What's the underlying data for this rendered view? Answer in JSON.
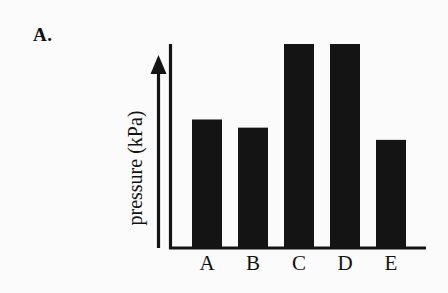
{
  "figure": {
    "panel_label": "A.",
    "background_color": "#fbfbfb",
    "ink_color": "#141414"
  },
  "chart_data": {
    "type": "bar",
    "title": "",
    "subtitle": "",
    "xlabel": "",
    "ylabel": "pressure (kPa)",
    "categories": [
      "A",
      "B",
      "C",
      "D",
      "E"
    ],
    "values": [
      63,
      59,
      100,
      100,
      53
    ],
    "series": [
      {
        "name": "pressure",
        "values": [
          63,
          59,
          100,
          100,
          53
        ]
      }
    ],
    "ylim": [
      0,
      110
    ],
    "grid": false,
    "legend": false,
    "legend_position": "none",
    "y_tick_labels": [],
    "x_tick_labels": [
      "A",
      "B",
      "C",
      "D",
      "E"
    ],
    "annotations": [
      "A."
    ],
    "bar_color": "#141414",
    "axis_color": "#141414",
    "y_axis_arrow": true
  },
  "axes": {
    "y_arrow_name": "upward-arrow",
    "x_axis_name": "baseline"
  }
}
